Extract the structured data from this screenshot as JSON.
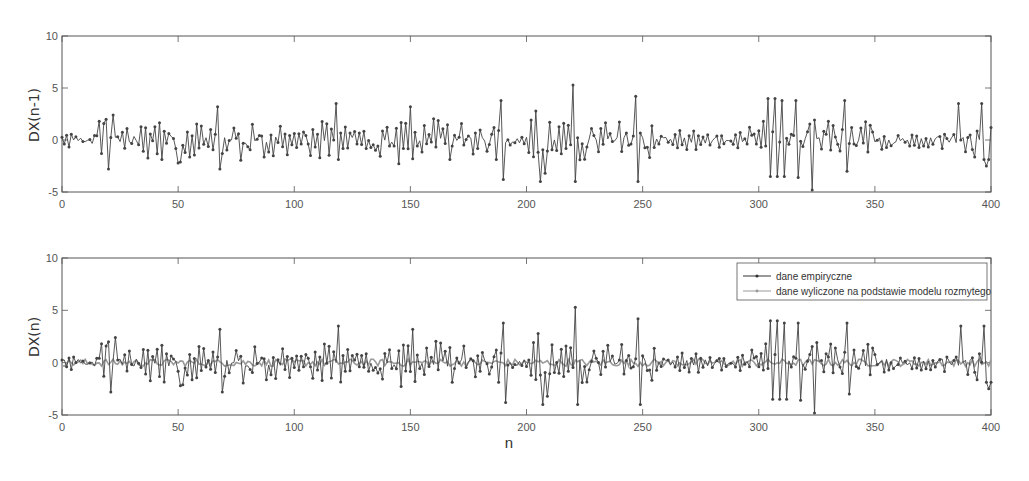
{
  "chart_data": [
    {
      "type": "line",
      "title": "",
      "xlabel": "",
      "ylabel": "DX(n-1)",
      "xlim": [
        0,
        400
      ],
      "ylim": [
        -5,
        10
      ],
      "xticks": [
        0,
        50,
        100,
        150,
        200,
        250,
        300,
        350,
        400
      ],
      "yticks": [
        -5,
        0,
        5,
        10
      ],
      "grid": false,
      "series": [
        {
          "name": "DX(n-1)",
          "marker": "dot",
          "color": "#444444",
          "notable_points": [
            {
              "n": 16,
              "y": 1.8
            },
            {
              "n": 17,
              "y": -1.3
            },
            {
              "n": 19,
              "y": 2.0
            },
            {
              "n": 20,
              "y": -2.8
            },
            {
              "n": 22,
              "y": 2.4
            },
            {
              "n": 50,
              "y": -2.2
            },
            {
              "n": 67,
              "y": 3.2
            },
            {
              "n": 68,
              "y": -2.8
            },
            {
              "n": 118,
              "y": 3.5
            },
            {
              "n": 150,
              "y": 3.2
            },
            {
              "n": 151,
              "y": -1.8
            },
            {
              "n": 189,
              "y": 3.8
            },
            {
              "n": 190,
              "y": -3.8
            },
            {
              "n": 204,
              "y": 2.8
            },
            {
              "n": 206,
              "y": -4.0
            },
            {
              "n": 208,
              "y": -3.2
            },
            {
              "n": 220,
              "y": 5.3
            },
            {
              "n": 221,
              "y": -4.0
            },
            {
              "n": 247,
              "y": 4.2
            },
            {
              "n": 248,
              "y": -4.0
            },
            {
              "n": 304,
              "y": 4.0
            },
            {
              "n": 305,
              "y": -3.5
            },
            {
              "n": 307,
              "y": 4.0
            },
            {
              "n": 308,
              "y": -3.5
            },
            {
              "n": 310,
              "y": 3.8
            },
            {
              "n": 311,
              "y": -3.5
            },
            {
              "n": 316,
              "y": 3.8
            },
            {
              "n": 317,
              "y": -3.6
            },
            {
              "n": 323,
              "y": -4.8
            },
            {
              "n": 337,
              "y": 3.8
            },
            {
              "n": 338,
              "y": -3.0
            },
            {
              "n": 386,
              "y": 3.5
            },
            {
              "n": 396,
              "y": 3.5
            },
            {
              "n": 398,
              "y": -2.5
            }
          ],
          "typical_range": [
            -2.5,
            2.5
          ]
        }
      ]
    },
    {
      "type": "line",
      "title": "",
      "xlabel": "n",
      "ylabel": "DX(n)",
      "xlim": [
        0,
        400
      ],
      "ylim": [
        -5,
        10
      ],
      "xticks": [
        0,
        50,
        100,
        150,
        200,
        250,
        300,
        350,
        400
      ],
      "yticks": [
        -5,
        0,
        5,
        10
      ],
      "grid": false,
      "legend": {
        "position": "upper right",
        "entries": [
          "dane empiryczne",
          "dane wyliczone na podstawie modelu rozmytego"
        ]
      },
      "series": [
        {
          "name": "dane empiryczne",
          "marker": "dot",
          "color": "#444444",
          "note": "same empirical series as upper panel shifted by one sample",
          "typical_range": [
            -2.5,
            2.5
          ],
          "extremes": {
            "max": 5.3,
            "max_n": 220,
            "min": -4.8,
            "min_n": 324
          }
        },
        {
          "name": "dane wyliczone na podstawie modelu rozmytego",
          "marker": "dot",
          "color": "#999999",
          "note": "fuzzy-model output, stays close to 0",
          "typical_range": [
            -0.5,
            0.5
          ]
        }
      ]
    }
  ],
  "axes": {
    "ticks_x": [
      "0",
      "50",
      "100",
      "150",
      "200",
      "250",
      "300",
      "350",
      "400"
    ],
    "ticks_y": [
      "10",
      "5",
      "0",
      "-5"
    ],
    "top_ylabel": "DX(n-1)",
    "bottom_ylabel": "DX(n)",
    "bottom_xlabel": "n"
  },
  "legend": {
    "entry1": "dane empiryczne",
    "entry2": "dane wyliczone na podstawie modelu rozmytego"
  },
  "colors": {
    "axis": "#555555",
    "empirical": "#444444",
    "model": "#9a9a9a",
    "background": "#ffffff"
  }
}
